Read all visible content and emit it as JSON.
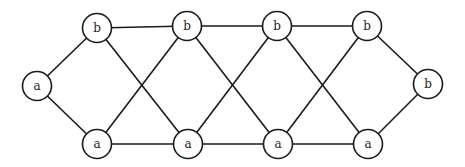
{
  "diagram": {
    "type": "graph",
    "colors": {
      "stroke": "#1a1a1a",
      "fill": "#ffffff",
      "text": "#222222"
    },
    "nodes": [
      {
        "id": "aL",
        "label": "a"
      },
      {
        "id": "b1",
        "label": "b"
      },
      {
        "id": "b2",
        "label": "b"
      },
      {
        "id": "b3",
        "label": "b"
      },
      {
        "id": "b4",
        "label": "b"
      },
      {
        "id": "a1",
        "label": "a"
      },
      {
        "id": "a2",
        "label": "a"
      },
      {
        "id": "a3",
        "label": "a"
      },
      {
        "id": "a4",
        "label": "a"
      },
      {
        "id": "bR",
        "label": "b"
      }
    ],
    "edges": [
      [
        "aL",
        "b1"
      ],
      [
        "aL",
        "a1"
      ],
      [
        "b1",
        "b2"
      ],
      [
        "b2",
        "b3"
      ],
      [
        "b3",
        "b4"
      ],
      [
        "a1",
        "a2"
      ],
      [
        "a2",
        "a3"
      ],
      [
        "a3",
        "a4"
      ],
      [
        "b1",
        "a2"
      ],
      [
        "a1",
        "b2"
      ],
      [
        "b2",
        "a3"
      ],
      [
        "a2",
        "b3"
      ],
      [
        "b3",
        "a4"
      ],
      [
        "a3",
        "b4"
      ],
      [
        "b4",
        "bR"
      ],
      [
        "a4",
        "bR"
      ]
    ]
  }
}
